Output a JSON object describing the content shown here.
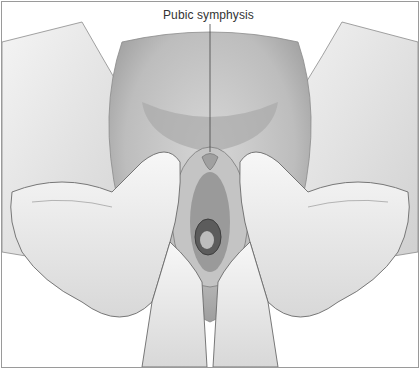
{
  "figure": {
    "label": "Pubic symphysis",
    "colors": {
      "frame": "#9a9a9a",
      "skin_light": "#f2f2f2",
      "skin_mid": "#d9d9d9",
      "skin_dark": "#a8a8a8",
      "shadow": "#6e6e6e",
      "label_text": "#333333"
    }
  }
}
